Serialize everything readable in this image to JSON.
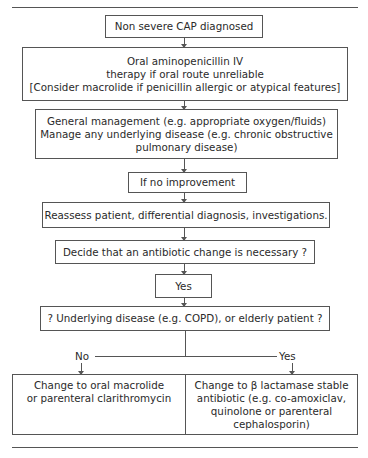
{
  "flowchart": {
    "start": {
      "text": "Non severe CAP diagnosed"
    },
    "initial_therapy": {
      "lines": [
        "Oral aminopenicillin IV",
        "therapy if oral route unreliable",
        "[Consider macrolide if penicillin allergic or atypical features]"
      ]
    },
    "general_management": {
      "lines": [
        "General management (e.g. appropriate oxygen/fluids)",
        "Manage any underlying disease (e.g. chronic obstructive",
        "pulmonary disease)"
      ]
    },
    "no_improvement": {
      "text": "If no improvement"
    },
    "reassess": {
      "text": "Reassess patient, differential diagnosis, investigations."
    },
    "decide_change": {
      "text": "Decide that an antibiotic change is necessary ?"
    },
    "yes_box": {
      "text": "Yes"
    },
    "underlying_question": {
      "text": "? Underlying disease (e.g. COPD), or elderly patient ?"
    },
    "branch_no_label": "No",
    "branch_yes_label": "Yes",
    "outcome_no": {
      "lines": [
        "Change to oral macrolide",
        "or parenteral clarithromycin"
      ]
    },
    "outcome_yes": {
      "lines": [
        "Change to β lactamase stable",
        "antibiotic (e.g. co-amoxiclav,",
        "quinolone or parenteral",
        "cephalosporin)"
      ]
    }
  }
}
